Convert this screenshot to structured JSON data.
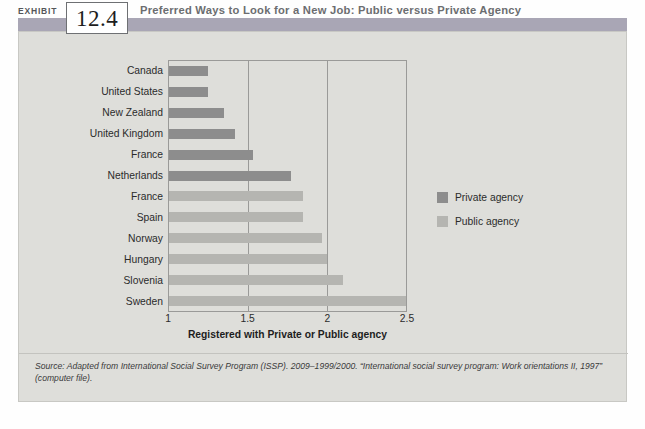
{
  "exhibit": {
    "label": "EXHIBIT",
    "number": "12.4",
    "title": "Preferred Ways to Look for a New Job: Public versus Private Agency"
  },
  "source_note": "Source: Adapted from International Social Survey Program (ISSP). 2009–1999/2000. “International social survey program: Work orientations II, 1997” (computer file).",
  "legend": {
    "items": [
      {
        "label": "Private agency",
        "color": "#8d8d8d",
        "key": "private"
      },
      {
        "label": "Public agency",
        "color": "#b5b5b1",
        "key": "public"
      }
    ]
  },
  "chart_data": {
    "type": "bar",
    "orientation": "horizontal",
    "title": "Preferred Ways to Look for a New Job: Public versus Private Agency",
    "xlabel": "Registered with Private or Public agency",
    "ylabel": "",
    "xlim": [
      1,
      2.5
    ],
    "xticks": [
      "1",
      "1.5",
      "2",
      "2.5"
    ],
    "xtick_values": [
      1,
      1.5,
      2,
      2.5
    ],
    "grid": true,
    "legend_position": "right",
    "categories": [
      "Canada",
      "United States",
      "New Zealand",
      "United Kingdom",
      "France",
      "Netherlands",
      "France",
      "Spain",
      "Norway",
      "Hungary",
      "Slovenia",
      "Sweden"
    ],
    "values": [
      1.25,
      1.25,
      1.35,
      1.42,
      1.53,
      1.77,
      1.85,
      1.85,
      1.97,
      2.0,
      2.1,
      2.5
    ],
    "groups": [
      "private",
      "private",
      "private",
      "private",
      "private",
      "private",
      "public",
      "public",
      "public",
      "public",
      "public",
      "public"
    ],
    "series": [
      {
        "name": "Private agency",
        "color": "#8d8d8d",
        "points": [
          {
            "category": "Canada",
            "value": 1.25
          },
          {
            "category": "United States",
            "value": 1.25
          },
          {
            "category": "New Zealand",
            "value": 1.35
          },
          {
            "category": "United Kingdom",
            "value": 1.42
          },
          {
            "category": "France",
            "value": 1.53
          },
          {
            "category": "Netherlands",
            "value": 1.77
          }
        ]
      },
      {
        "name": "Public agency",
        "color": "#b5b5b1",
        "points": [
          {
            "category": "France",
            "value": 1.85
          },
          {
            "category": "Spain",
            "value": 1.85
          },
          {
            "category": "Norway",
            "value": 1.97
          },
          {
            "category": "Hungary",
            "value": 2.0
          },
          {
            "category": "Slovenia",
            "value": 2.1
          },
          {
            "category": "Sweden",
            "value": 2.5
          }
        ]
      }
    ]
  },
  "colors": {
    "header_bar": "#a9a6b5",
    "panel_bg": "#dededa",
    "private": "#8d8d8d",
    "public": "#b5b5b1",
    "axis": "#9a9a98"
  }
}
